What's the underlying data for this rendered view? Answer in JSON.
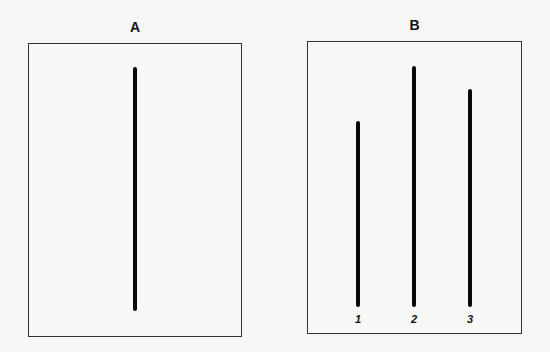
{
  "panels": [
    {
      "title": "A",
      "box": {
        "left": 28,
        "top": 43,
        "right": 242,
        "bottom": 337
      },
      "lines": [
        {
          "label": "",
          "x": 135,
          "top": 67,
          "bottom": 311
        }
      ]
    },
    {
      "title": "B",
      "box": {
        "left": 307,
        "top": 41,
        "right": 522,
        "bottom": 334
      },
      "lines": [
        {
          "label": "1",
          "x": 358,
          "top": 121,
          "bottom": 307
        },
        {
          "label": "2",
          "x": 414,
          "top": 66,
          "bottom": 307
        },
        {
          "label": "3",
          "x": 470,
          "top": 89,
          "bottom": 307
        }
      ]
    }
  ],
  "colors": {
    "line": "#0a0a0a",
    "border": "#333333",
    "background": "#f6f6f4"
  }
}
